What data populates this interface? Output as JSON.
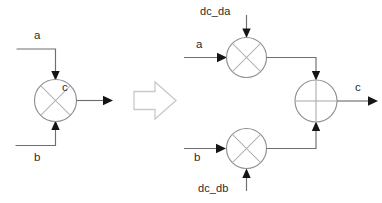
{
  "diagram": {
    "colors": {
      "wire": "#6e6e6e",
      "node_stroke": "#8f8f8f",
      "node_glyph": "#a8a8a8",
      "arrow_head": "#151515",
      "big_arrow_stroke": "#c9c9c9",
      "text": "#2b2b2b",
      "background": "#ffffff"
    },
    "left_block": {
      "name": "single-multiplier-block",
      "inputs": [
        {
          "id": "a",
          "label": "a",
          "direction": "down-into-node"
        },
        {
          "id": "b",
          "label": "b",
          "direction": "up-into-node"
        }
      ],
      "node": {
        "id": "mult",
        "glyph": "multiply-x",
        "label": ""
      },
      "outputs": [
        {
          "id": "c",
          "label": "c",
          "direction": "right-out-of-node"
        }
      ]
    },
    "transition": {
      "name": "transform-arrow",
      "glyph": "right-block-arrow",
      "label": ""
    },
    "right_block": {
      "name": "expanded-multiplier-adder-block",
      "nodes": [
        {
          "id": "mult_top",
          "glyph": "multiply-x"
        },
        {
          "id": "mult_bottom",
          "glyph": "multiply-x"
        },
        {
          "id": "adder",
          "glyph": "plus-cross"
        }
      ],
      "inputs": [
        {
          "id": "dc_da",
          "label": "dc_da",
          "target": "mult_top",
          "direction": "down-into-node"
        },
        {
          "id": "a",
          "label": "a",
          "target": "mult_top",
          "direction": "right-into-node"
        },
        {
          "id": "b",
          "label": "b",
          "target": "mult_bottom",
          "direction": "right-into-node"
        },
        {
          "id": "dc_db",
          "label": "dc_db",
          "target": "mult_bottom",
          "direction": "up-into-node"
        }
      ],
      "outputs": [
        {
          "id": "c",
          "label": "c",
          "source": "adder",
          "direction": "right-out-of-node"
        }
      ]
    }
  }
}
